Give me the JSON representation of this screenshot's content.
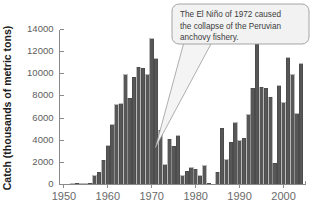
{
  "figure": {
    "name": "peruvian-anchovy-catch-chart"
  },
  "annotation": {
    "name": "el-nino-callout",
    "line1": "The El Niño of 1972 caused",
    "line2": "the collapse of the Peruvian",
    "line3": "anchovy fishery.",
    "full_text": "The El Niño of 1972 caused the collapse of the Peruvian anchovy fishery.",
    "points_to_year": 1972
  },
  "colors": {
    "bar_fill": "#575757",
    "bar_edge": "#3a3a3a",
    "axis": "#8a8a8a",
    "tick_text": "#6a6a6a",
    "axis_title": "#1c1c1c",
    "callout_fill": "#f2f2f2",
    "callout_border": "#9b9b9b",
    "background": "#ffffff"
  },
  "chart_data": {
    "type": "bar",
    "title": "",
    "subtitle": "",
    "xlabel": "",
    "ylabel": "Catch (thousands of metric tons)",
    "xlim": [
      1949,
      2005
    ],
    "ylim": [
      0,
      14000
    ],
    "grid": false,
    "legend": null,
    "yticks": [
      0,
      2000,
      4000,
      6000,
      8000,
      10000,
      12000,
      14000
    ],
    "ytick_labels": [
      "0",
      "2000",
      "4000",
      "6000",
      "8000",
      "10000",
      "12000",
      "14000"
    ],
    "xticks": [
      1950,
      1960,
      1970,
      1980,
      1990,
      2000
    ],
    "xtick_labels": [
      "1950",
      "1960",
      "1970",
      "1980",
      "1990",
      "2000"
    ],
    "annotations": [
      {
        "text": "The El Niño of 1972 caused the collapse of the Peruvian anchovy fishery.",
        "target_year": 1972
      }
    ],
    "categories": [
      1950,
      1951,
      1952,
      1953,
      1954,
      1955,
      1956,
      1957,
      1958,
      1959,
      1960,
      1961,
      1962,
      1963,
      1964,
      1965,
      1966,
      1967,
      1968,
      1969,
      1970,
      1971,
      1972,
      1973,
      1974,
      1975,
      1976,
      1977,
      1978,
      1979,
      1980,
      1981,
      1982,
      1983,
      1984,
      1985,
      1986,
      1987,
      1988,
      1989,
      1990,
      1991,
      1992,
      1993,
      1994,
      1995,
      1996,
      1997,
      1998,
      1999,
      2000,
      2001,
      2002,
      2003,
      2004
    ],
    "values": [
      0,
      0,
      60,
      110,
      50,
      60,
      120,
      800,
      1100,
      2200,
      3500,
      5400,
      7200,
      7300,
      9900,
      7800,
      9700,
      10600,
      10500,
      9900,
      13150,
      11350,
      4900,
      1800,
      4100,
      3450,
      4400,
      800,
      1200,
      1500,
      1400,
      800,
      1700,
      120,
      30,
      1100,
      5100,
      2250,
      3800,
      5600,
      3950,
      4200,
      6300,
      8700,
      12650,
      8800,
      8700,
      7900,
      1900,
      8900,
      7400,
      11450,
      9900,
      6400,
      10900
    ]
  }
}
